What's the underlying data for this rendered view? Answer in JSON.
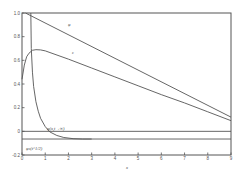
{
  "chart_data": {
    "type": "line",
    "title": "",
    "xlabel": "x",
    "ylabel": "",
    "xlim": [
      0,
      9
    ],
    "ylim": [
      -0.2,
      1.0
    ],
    "grid": false,
    "x_ticks": [
      0,
      1,
      2,
      3,
      4,
      5,
      6,
      7,
      8,
      9
    ],
    "y_ticks": [
      -0.2,
      0,
      0.2,
      0.4,
      0.6,
      0.8,
      1.0
    ],
    "y_tick_labels": [
      "-0.2",
      "0",
      "0.2",
      "0.4",
      "0.6",
      "0.8",
      "1.0"
    ],
    "series": [
      {
        "name": "φ",
        "label_pos": [
          2.0,
          0.88
        ],
        "points": [
          [
            0.15,
            1.0
          ],
          [
            9.0,
            0.12
          ]
        ]
      },
      {
        "name": "ε",
        "label_pos": [
          2.2,
          0.61
        ],
        "points": [
          [
            0.0,
            0.44
          ],
          [
            0.1,
            0.56
          ],
          [
            0.2,
            0.63
          ],
          [
            0.3,
            0.66
          ],
          [
            0.45,
            0.685
          ],
          [
            0.6,
            0.69
          ],
          [
            0.8,
            0.688
          ],
          [
            1.0,
            0.68
          ],
          [
            2.0,
            0.61
          ],
          [
            3.0,
            0.535
          ],
          [
            4.0,
            0.46
          ],
          [
            5.0,
            0.385
          ],
          [
            6.0,
            0.31
          ],
          [
            7.0,
            0.24
          ],
          [
            8.0,
            0.165
          ],
          [
            9.0,
            0.09
          ]
        ]
      },
      {
        "name": "φ(x, t → ∞)",
        "label_pos": [
          1.05,
          0.04
        ],
        "points": [
          [
            0.38,
            1.0
          ],
          [
            0.4,
            0.7
          ],
          [
            0.45,
            0.5
          ],
          [
            0.5,
            0.38
          ],
          [
            0.6,
            0.25
          ],
          [
            0.7,
            0.17
          ],
          [
            0.8,
            0.11
          ],
          [
            1.0,
            0.04
          ],
          [
            1.2,
            -0.005
          ],
          [
            1.5,
            -0.035
          ],
          [
            1.8,
            -0.052
          ],
          [
            2.2,
            -0.062
          ],
          [
            2.6,
            -0.065
          ],
          [
            3.0,
            -0.065
          ]
        ]
      },
      {
        "name": "zero line",
        "points": [
          [
            0.0,
            0.0
          ],
          [
            9.0,
            0.0
          ]
        ]
      },
      {
        "name": "φ_s(t^{1/2})",
        "label_pos": [
          0.4,
          -0.115
        ],
        "points": [
          [
            0.0,
            -0.065
          ],
          [
            9.0,
            -0.065
          ]
        ]
      }
    ],
    "annotations": [
      "φ",
      "ε",
      "φ(x, t → ∞)",
      "φ_s(t^{1/2})"
    ]
  },
  "labels": {
    "x_axis": "x",
    "curve_phi": "φ",
    "curve_eps": "ε",
    "curve_limit": "φ(x,t→∞)",
    "curve_s": "φs(t^1/2)"
  }
}
